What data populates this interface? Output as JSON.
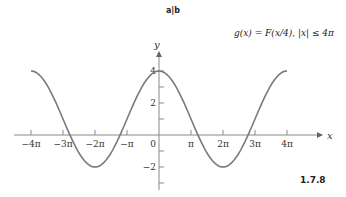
{
  "header": {
    "label": "a|b"
  },
  "figure_number": "1.7.8",
  "formula": "g(x) = F(x/4),  |x| ≤ 4π",
  "axes": {
    "x_label": "x",
    "y_label": "y"
  },
  "colors": {
    "curve": "#7a7a7a",
    "axis": "#888888",
    "text": "#222222"
  },
  "chart_data": {
    "type": "line",
    "title": "g(x) = F(x/4), |x| ≤ 4π",
    "xlabel": "x",
    "ylabel": "y",
    "xlim": [
      -12.566,
      12.566
    ],
    "ylim": [
      -3,
      5
    ],
    "x_ticks": [
      "-4π",
      "-3π",
      "-2π",
      "-π",
      "0",
      "π",
      "2π",
      "3π",
      "4π"
    ],
    "y_ticks": [
      "-2",
      "2",
      "4"
    ],
    "grid": false,
    "series": [
      {
        "name": "g(x)",
        "x": [
          "-4π",
          "-3π",
          "-2π",
          "-π",
          "0",
          "π",
          "2π",
          "3π",
          "4π"
        ],
        "values": [
          4,
          1,
          -2,
          1,
          4,
          1,
          -2,
          1,
          4
        ]
      }
    ],
    "annotations": [
      "1.7.8",
      "a|b"
    ]
  }
}
